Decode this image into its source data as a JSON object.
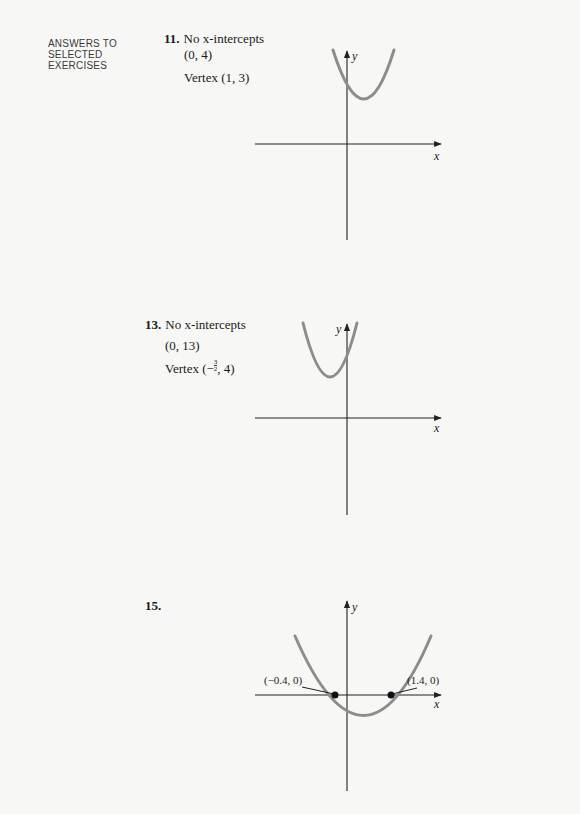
{
  "side_label": [
    "ANSWERS TO",
    "SELECTED",
    "EXERCISES"
  ],
  "exercises": [
    {
      "number": "11.",
      "lines": [
        "No x-intercepts",
        "(0, 4)",
        "Vertex (1, 3)"
      ],
      "graph": {
        "y_label": "y",
        "x_label": "x",
        "vertex": [
          1,
          3
        ],
        "y_intercept": [
          0,
          4
        ],
        "x_intercepts": []
      }
    },
    {
      "number": "13.",
      "lines": [
        "No x-intercepts",
        "(0, 13)"
      ],
      "vertex_prefix": "Vertex (−",
      "vertex_frac_num": "3",
      "vertex_frac_den": "2",
      "vertex_suffix": ", 4)",
      "graph": {
        "y_label": "y",
        "x_label": "x",
        "vertex": [
          -1.5,
          4
        ],
        "y_intercept": [
          0,
          13
        ],
        "x_intercepts": []
      }
    },
    {
      "number": "15.",
      "lines": [],
      "graph": {
        "y_label": "y",
        "x_label": "x",
        "x_intercepts": [
          -0.4,
          1.4
        ],
        "point_labels": [
          "(−0.4, 0)",
          "(1.4, 0)"
        ]
      }
    }
  ],
  "colors": {
    "curve": "#8d8d8d",
    "axis": "#222222",
    "paper": "#f7f7f5"
  }
}
